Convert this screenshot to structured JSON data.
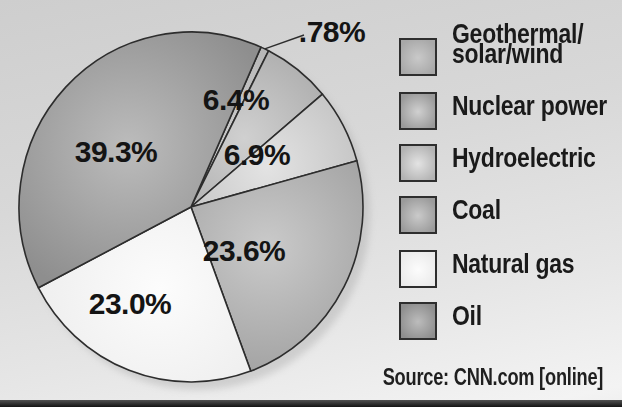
{
  "chart_data": {
    "type": "pie",
    "start_angle_deg": 24,
    "slices": [
      {
        "name": "Geothermal/solar/wind",
        "value": 0.78,
        "value_label": ".78%",
        "color_base": "#a8a8a8",
        "color_light": "#c9c9c9"
      },
      {
        "name": "Nuclear power",
        "value": 6.4,
        "value_label": "6.4%",
        "color_base": "#9a9a9a",
        "color_light": "#d0d0d0"
      },
      {
        "name": "Hydroelectric",
        "value": 6.9,
        "value_label": "6.9%",
        "color_base": "#b3b3b3",
        "color_light": "#e3e3e3"
      },
      {
        "name": "Coal",
        "value": 23.6,
        "value_label": "23.6%",
        "color_base": "#9b9b9b",
        "color_light": "#cacaca"
      },
      {
        "name": "Natural gas",
        "value": 23.0,
        "value_label": "23.0%",
        "color_base": "#ebebeb",
        "color_light": "#fcfcfc"
      },
      {
        "name": "Oil",
        "value": 39.3,
        "value_label": "39.3%",
        "color_base": "#8e8e8e",
        "color_light": "#bcbcbc"
      }
    ],
    "legend": [
      {
        "slice": 0,
        "lines": [
          "Geothermal/",
          "solar/wind"
        ]
      },
      {
        "slice": 1,
        "lines": [
          "Nuclear power"
        ]
      },
      {
        "slice": 2,
        "lines": [
          "Hydroelectric"
        ]
      },
      {
        "slice": 3,
        "lines": [
          "Coal"
        ]
      },
      {
        "slice": 4,
        "lines": [
          "Natural gas"
        ]
      },
      {
        "slice": 5,
        "lines": [
          "Oil"
        ]
      }
    ],
    "legend_position": "right",
    "source": "Source: CNN.com [online]"
  },
  "colors": {
    "outline": "#2d2d2d",
    "label_text": "#141414",
    "background_top": "#cecece",
    "background_bottom": "#f3f3f3",
    "bottom_bar": "#141414"
  }
}
